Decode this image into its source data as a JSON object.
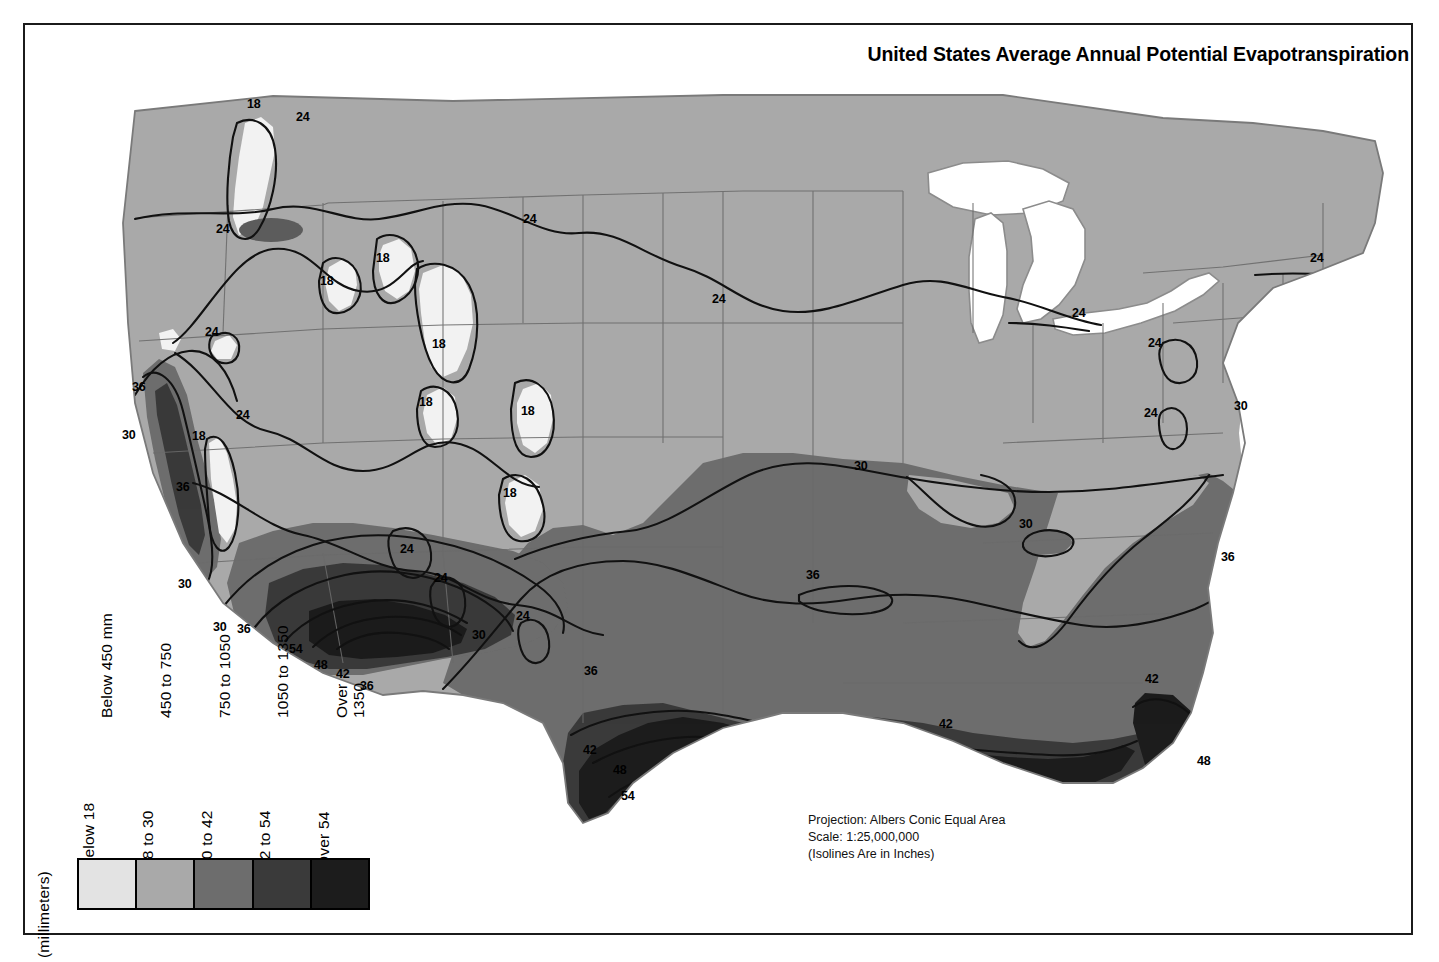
{
  "figure": {
    "title": "United States Average Annual Potential Evapotranspiration",
    "background": "#ffffff",
    "frame_color": "#1b1b1b"
  },
  "credits": {
    "projection": "Projection: Albers Conic Equal Area",
    "scale": "Scale: 1:25,000,000",
    "isoline_note": "(Isolines Are in Inches)"
  },
  "legend": {
    "row_label_mm": "(millimeters)",
    "row_label_in": "(inches)",
    "classes": [
      {
        "mm": "Below 450 mm",
        "inches": "Below 18",
        "color": "#e3e3e3"
      },
      {
        "mm": "450 to 750",
        "inches": "18 to 30",
        "color": "#a9a9a9"
      },
      {
        "mm": "750 to 1050",
        "inches": "30 to 42",
        "color": "#6d6d6d"
      },
      {
        "mm": "1050 to 1350",
        "inches": "42 to 54",
        "color": "#3a3a3a"
      },
      {
        "mm": "Over\n1350",
        "inches": "Over 54",
        "color": "#1c1c1c"
      }
    ]
  },
  "chart_data": {
    "type": "map",
    "title": "United States Average Annual Potential Evapotranspiration",
    "subtitle": "Projection: Albers Conic Equal Area — Scale 1:25,000,000",
    "variable": "Average annual potential evapotranspiration",
    "units_primary": "inches",
    "units_secondary": "millimeters",
    "region": "Conterminous United States",
    "projection": "Albers Conic Equal Area",
    "scale": "1:25,000,000",
    "isoline_units": "inches",
    "isoline_values": [
      18,
      24,
      30,
      36,
      42,
      48,
      54
    ],
    "class_breaks_inches": [
      18,
      30,
      42,
      54
    ],
    "class_breaks_mm": [
      450,
      750,
      1050,
      1350
    ],
    "classes": [
      {
        "label_in": "Below 18",
        "label_mm": "Below 450 mm",
        "color": "#e3e3e3",
        "min_in": null,
        "max_in": 18,
        "min_mm": null,
        "max_mm": 450
      },
      {
        "label_in": "18 to 30",
        "label_mm": "450 to 750",
        "color": "#a9a9a9",
        "min_in": 18,
        "max_in": 30,
        "min_mm": 450,
        "max_mm": 750
      },
      {
        "label_in": "30 to 42",
        "label_mm": "750 to 1050",
        "color": "#6d6d6d",
        "min_in": 30,
        "max_in": 42,
        "min_mm": 750,
        "max_mm": 1050
      },
      {
        "label_in": "42 to 54",
        "label_mm": "1050 to 1350",
        "color": "#3a3a3a",
        "min_in": 42,
        "max_in": 54,
        "min_mm": 1050,
        "max_mm": 1350
      },
      {
        "label_in": "Over 54",
        "label_mm": "Over 1350",
        "color": "#1c1c1c",
        "min_in": 54,
        "max_in": null,
        "min_mm": 1350,
        "max_mm": null
      }
    ],
    "isoline_labels": [
      {
        "value": "18",
        "x": 247,
        "y": 98
      },
      {
        "value": "24",
        "x": 296,
        "y": 111
      },
      {
        "value": "24",
        "x": 216,
        "y": 223
      },
      {
        "value": "18",
        "x": 320,
        "y": 275
      },
      {
        "value": "18",
        "x": 376,
        "y": 252
      },
      {
        "value": "24",
        "x": 523,
        "y": 213
      },
      {
        "value": "24",
        "x": 712,
        "y": 293
      },
      {
        "value": "24",
        "x": 1072,
        "y": 307
      },
      {
        "value": "24",
        "x": 1310,
        "y": 252
      },
      {
        "value": "24",
        "x": 1148,
        "y": 337
      },
      {
        "value": "24",
        "x": 205,
        "y": 326
      },
      {
        "value": "36",
        "x": 132,
        "y": 381
      },
      {
        "value": "30",
        "x": 122,
        "y": 429
      },
      {
        "value": "18",
        "x": 192,
        "y": 430
      },
      {
        "value": "18",
        "x": 432,
        "y": 338
      },
      {
        "value": "24",
        "x": 236,
        "y": 409
      },
      {
        "value": "18",
        "x": 419,
        "y": 396
      },
      {
        "value": "18",
        "x": 521,
        "y": 405
      },
      {
        "value": "36",
        "x": 176,
        "y": 481
      },
      {
        "value": "18",
        "x": 503,
        "y": 487
      },
      {
        "value": "24",
        "x": 400,
        "y": 543
      },
      {
        "value": "30",
        "x": 178,
        "y": 578
      },
      {
        "value": "24",
        "x": 434,
        "y": 572
      },
      {
        "value": "30",
        "x": 854,
        "y": 460
      },
      {
        "value": "30",
        "x": 1019,
        "y": 518
      },
      {
        "value": "36",
        "x": 1221,
        "y": 551
      },
      {
        "value": "30",
        "x": 1234,
        "y": 400
      },
      {
        "value": "24",
        "x": 1144,
        "y": 407
      },
      {
        "value": "30",
        "x": 213,
        "y": 621
      },
      {
        "value": "36",
        "x": 237,
        "y": 623
      },
      {
        "value": "54",
        "x": 289,
        "y": 643
      },
      {
        "value": "48",
        "x": 314,
        "y": 659
      },
      {
        "value": "42",
        "x": 336,
        "y": 668
      },
      {
        "value": "36",
        "x": 360,
        "y": 680
      },
      {
        "value": "30",
        "x": 472,
        "y": 629
      },
      {
        "value": "24",
        "x": 516,
        "y": 610
      },
      {
        "value": "36",
        "x": 584,
        "y": 665
      },
      {
        "value": "36",
        "x": 806,
        "y": 569
      },
      {
        "value": "42",
        "x": 583,
        "y": 744
      },
      {
        "value": "48",
        "x": 613,
        "y": 764
      },
      {
        "value": "54",
        "x": 621,
        "y": 790
      },
      {
        "value": "42",
        "x": 939,
        "y": 718
      },
      {
        "value": "42",
        "x": 1145,
        "y": 673
      },
      {
        "value": "48",
        "x": 1197,
        "y": 755
      }
    ]
  }
}
